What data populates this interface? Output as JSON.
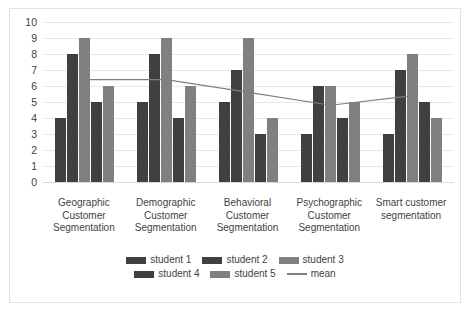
{
  "chart_data": {
    "type": "bar",
    "title": "",
    "xlabel": "",
    "ylabel": "",
    "ylim": [
      0,
      10
    ],
    "y_ticks": [
      10,
      9,
      8,
      7,
      6,
      5,
      4,
      3,
      2,
      1,
      0
    ],
    "grid": true,
    "legend_position": "bottom",
    "categories": [
      "Geographic Customer Segmentation",
      "Demographic Customer Segmentation",
      "Behavioral Customer Segmentation",
      "Psychographic Customer Segmentation",
      "Smart customer segmentation"
    ],
    "category_lines": [
      [
        "Geographic",
        "Customer",
        "Segmentation"
      ],
      [
        "Demographic",
        "Customer",
        "Segmentation"
      ],
      [
        "Behavioral",
        "Customer",
        "Segmentation"
      ],
      [
        "Psychographic",
        "Customer",
        "Segmentation"
      ],
      [
        "Smart customer",
        "segmentation"
      ]
    ],
    "series": [
      {
        "name": "student 1",
        "type": "bar",
        "color": "#404040",
        "values": [
          4,
          5,
          5,
          3,
          3
        ]
      },
      {
        "name": "student 2",
        "type": "bar",
        "color": "#404040",
        "values": [
          8,
          8,
          7,
          6,
          7
        ]
      },
      {
        "name": "student 3",
        "type": "bar",
        "color": "#808080",
        "values": [
          9,
          9,
          9,
          6,
          8
        ]
      },
      {
        "name": "student 4",
        "type": "bar",
        "color": "#404040",
        "values": [
          5,
          4,
          3,
          4,
          5
        ]
      },
      {
        "name": "student 5",
        "type": "bar",
        "color": "#808080",
        "values": [
          6,
          6,
          4,
          5,
          4
        ]
      },
      {
        "name": "mean",
        "type": "line",
        "color": "#808080",
        "values": [
          6.4,
          6.4,
          5.6,
          4.8,
          5.4
        ]
      }
    ]
  },
  "legend": {
    "rows": [
      [
        {
          "label": "student 1",
          "swatch": "dark"
        },
        {
          "label": "student 2",
          "swatch": "dark"
        },
        {
          "label": "student 3",
          "swatch": "light"
        }
      ],
      [
        {
          "label": "student 4",
          "swatch": "dark"
        },
        {
          "label": "student 5",
          "swatch": "light"
        },
        {
          "label": "mean",
          "swatch": "line"
        }
      ]
    ]
  }
}
